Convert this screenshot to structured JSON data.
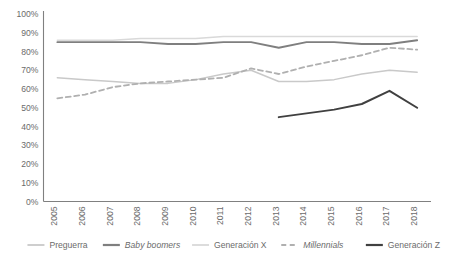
{
  "chart_data": {
    "type": "line",
    "title": "",
    "subtitle": "",
    "xlabel": "",
    "ylabel": "",
    "grid": false,
    "legend_position": "bottom",
    "x": [
      "2005",
      "2006",
      "2007",
      "2008",
      "2009",
      "2010",
      "2011",
      "2012",
      "2013",
      "2014",
      "2015",
      "2016",
      "2017",
      "2018"
    ],
    "xtick_labels": [
      "2005",
      "2006",
      "2007",
      "2008",
      "2009",
      "2010",
      "2011",
      "2012",
      "2013",
      "2014",
      "2015",
      "2016",
      "2017",
      "2018"
    ],
    "ytick_labels": [
      "0%",
      "10%",
      "20%",
      "30%",
      "40%",
      "50%",
      "60%",
      "70%",
      "80%",
      "90%",
      "100%"
    ],
    "ytick_values": [
      0,
      10,
      20,
      30,
      40,
      50,
      60,
      70,
      80,
      90,
      100
    ],
    "ylim": [
      0,
      100
    ],
    "series": [
      {
        "name": "Preguerra",
        "color": "#c9c9c9",
        "style": "solid",
        "width": 1.5,
        "values": [
          66,
          65,
          64,
          63,
          63,
          65,
          68,
          70,
          64,
          64,
          65,
          68,
          70,
          69
        ]
      },
      {
        "name": "Baby boomers",
        "color": "#7f7f7f",
        "style": "solid",
        "width": 1.8,
        "values": [
          85,
          85,
          85,
          85,
          84,
          84,
          85,
          85,
          82,
          85,
          85,
          84,
          84,
          86
        ]
      },
      {
        "name": "Generación X",
        "color": "#d9d9d9",
        "style": "solid",
        "width": 1.5,
        "values": [
          86,
          86,
          86,
          87,
          87,
          87,
          88,
          88,
          88,
          88,
          88,
          88,
          88,
          88
        ]
      },
      {
        "name": "Millennials",
        "color": "#b0b0b0",
        "style": "dashed",
        "width": 1.8,
        "values": [
          55,
          57,
          61,
          63,
          64,
          65,
          66,
          71,
          68,
          72,
          75,
          78,
          82,
          81
        ]
      },
      {
        "name": "Generación Z",
        "color": "#404040",
        "style": "solid",
        "width": 2.0,
        "values": [
          null,
          null,
          null,
          null,
          null,
          null,
          null,
          null,
          45,
          47,
          49,
          52,
          59,
          50
        ]
      }
    ],
    "legend": [
      {
        "label": "Preguerra",
        "color": "#c9c9c9",
        "style": "solid",
        "italic": false
      },
      {
        "label": "Baby boomers",
        "color": "#7f7f7f",
        "style": "solid",
        "italic": true
      },
      {
        "label": "Generación X",
        "color": "#d9d9d9",
        "style": "solid",
        "italic": false
      },
      {
        "label": "Millennials",
        "color": "#b0b0b0",
        "style": "dashed",
        "italic": true
      },
      {
        "label": "Generación Z",
        "color": "#404040",
        "style": "solid",
        "italic": false
      }
    ],
    "axis_color": "#808080"
  }
}
